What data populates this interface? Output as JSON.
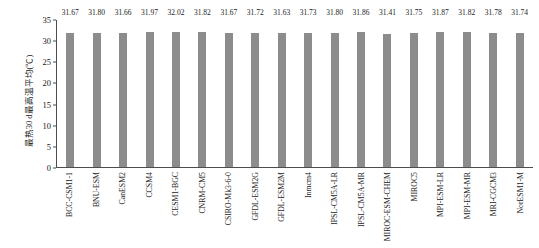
{
  "chart_data": {
    "type": "bar",
    "title": "",
    "xlabel": "",
    "ylabel": "最热30 d最高温平均(℃)",
    "ylim": [
      0,
      35
    ],
    "yticks": [
      0,
      5,
      10,
      15,
      20,
      25,
      30,
      35
    ],
    "grid": false,
    "legend": null,
    "bar_color": "#8c8c8c",
    "axis_color": "#4d4d4d",
    "text_color": "#1a1a1a",
    "categories": [
      "BCC-CSM1-1",
      "BNU-ESM",
      "CanESM2",
      "CCSM4",
      "CESM1-BGC",
      "CNRM-CM5",
      "CSIRO-Mk3-6-0",
      "GFDL-ESM2G",
      "GFDL-ESM2M",
      "Inmcm4",
      "IPSL-CM5A-LR",
      "IPSL-CM5A-MR",
      "MIROC-ESM-CHEM",
      "MIROC5",
      "MPI-ESM-LR",
      "MPI-ESM-MR",
      "MRI-CGCM3",
      "NorESM1-M"
    ],
    "values": [
      31.67,
      31.8,
      31.66,
      31.97,
      32.02,
      31.82,
      31.67,
      31.72,
      31.63,
      31.73,
      31.8,
      31.86,
      31.41,
      31.75,
      31.87,
      31.82,
      31.78,
      31.74
    ],
    "value_labels": [
      "31.67",
      "31.80",
      "31.66",
      "31.97",
      "32.02",
      "31.82",
      "31.67",
      "31.72",
      "31.63",
      "31.73",
      "31.80",
      "31.86",
      "31.41",
      "31.75",
      "31.87",
      "31.82",
      "31.78",
      "31.74"
    ]
  }
}
